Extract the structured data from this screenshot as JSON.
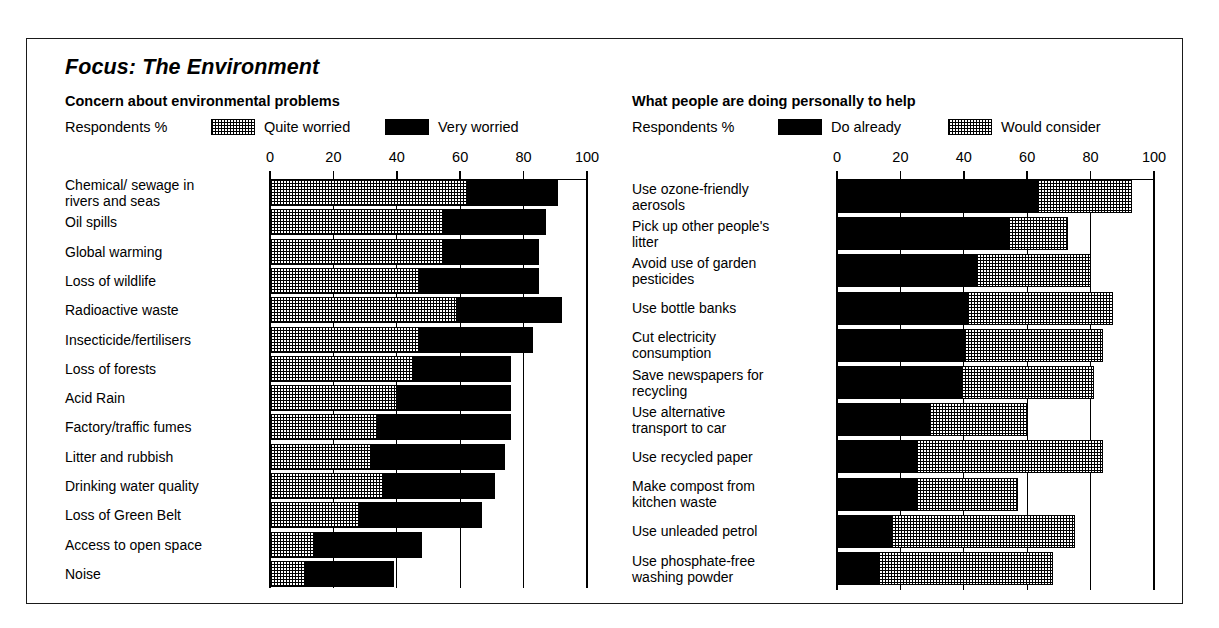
{
  "figure": {
    "title": "Focus: The Environment"
  },
  "panels": [
    {
      "id": "concern",
      "heading": "Concern about environmental problems",
      "unit_label": "Respondents %",
      "legend": [
        {
          "label": "Quite worried",
          "style": "dotted"
        },
        {
          "label": "Very worried",
          "style": "solid-black"
        }
      ]
    },
    {
      "id": "actions",
      "heading": "What people are doing personally to help",
      "unit_label": "Respondents %",
      "legend": [
        {
          "label": "Do already",
          "style": "solid-black"
        },
        {
          "label": "Would consider",
          "style": "dotted"
        }
      ]
    }
  ],
  "chart_data": [
    {
      "type": "bar",
      "orientation": "horizontal",
      "stacked": true,
      "title": "Concern about environmental problems",
      "xlabel": "Respondents %",
      "ylabel": "",
      "xlim": [
        0,
        100
      ],
      "ticks": [
        0,
        20,
        40,
        60,
        80,
        100
      ],
      "grid": true,
      "legend_position": "top",
      "categories": [
        "Chemical/ sewage in rivers and seas",
        "Oil spills",
        "Global warming",
        "Loss of wildlife",
        "Radioactive waste",
        "Insecticide/fertilisers",
        "Loss of forests",
        "Acid Rain",
        "Factory/traffic fumes",
        "Litter and rubbish",
        "Drinking water quality",
        "Loss of Green Belt",
        "Access to open space",
        "Noise"
      ],
      "series": [
        {
          "name": "Quite worried",
          "style": "dotted",
          "values": [
            62,
            55,
            55,
            47,
            59,
            47,
            45,
            40,
            34,
            32,
            36,
            28,
            14,
            11
          ]
        },
        {
          "name": "Very worried",
          "style": "solid-black",
          "values": [
            29,
            32,
            30,
            38,
            33,
            36,
            31,
            36,
            42,
            42,
            35,
            39,
            34,
            28
          ]
        }
      ],
      "totals": [
        91,
        87,
        85,
        85,
        92,
        83,
        76,
        76,
        76,
        74,
        71,
        67,
        48,
        39
      ]
    },
    {
      "type": "bar",
      "orientation": "horizontal",
      "stacked": true,
      "title": "What people are doing personally to help",
      "xlabel": "Respondents %",
      "ylabel": "",
      "xlim": [
        0,
        100
      ],
      "ticks": [
        0,
        20,
        40,
        60,
        80,
        100
      ],
      "grid": true,
      "legend_position": "top",
      "categories": [
        "Use ozone-friendly aerosols",
        "Pick up other people's litter",
        "Avoid use of garden pesticides",
        "Use bottle banks",
        "Cut electricity consumption",
        "Save newspapers for recycling",
        "Use alternative transport to car",
        "Use recycled paper",
        "Make compost from kitchen waste",
        "Use unleaded petrol",
        "Use phosphate-free washing powder"
      ],
      "series": [
        {
          "name": "Do already",
          "style": "solid-black",
          "values": [
            63,
            54,
            44,
            41,
            40,
            39,
            29,
            25,
            25,
            17,
            13
          ]
        },
        {
          "name": "Would consider",
          "style": "dotted",
          "values": [
            30,
            19,
            36,
            46,
            44,
            42,
            31,
            59,
            32,
            58,
            55
          ]
        }
      ],
      "totals": [
        93,
        73,
        80,
        87,
        84,
        81,
        60,
        84,
        57,
        75,
        68
      ]
    }
  ],
  "left_rows": [
    {
      "label": "Chemical/ sewage in\nrivers and seas",
      "quite": 62,
      "very": 29
    },
    {
      "label": "Oil spills",
      "quite": 55,
      "very": 32
    },
    {
      "label": "Global warming",
      "quite": 55,
      "very": 30
    },
    {
      "label": "Loss of wildlife",
      "quite": 47,
      "very": 38
    },
    {
      "label": "Radioactive waste",
      "quite": 59,
      "very": 33
    },
    {
      "label": "Insecticide/fertilisers",
      "quite": 47,
      "very": 36
    },
    {
      "label": "Loss of forests",
      "quite": 45,
      "very": 31
    },
    {
      "label": "Acid Rain",
      "quite": 40,
      "very": 36
    },
    {
      "label": "Factory/traffic fumes",
      "quite": 34,
      "very": 42
    },
    {
      "label": "Litter and rubbish",
      "quite": 32,
      "very": 42
    },
    {
      "label": "Drinking water quality",
      "quite": 36,
      "very": 35
    },
    {
      "label": "Loss of Green Belt",
      "quite": 28,
      "very": 39
    },
    {
      "label": "Access to open space",
      "quite": 14,
      "very": 34
    },
    {
      "label": "Noise",
      "quite": 11,
      "very": 28
    }
  ],
  "right_rows": [
    {
      "label": "Use ozone-friendly\naerosols",
      "already": 63,
      "consider": 30
    },
    {
      "label": "Pick up other people's\nlitter",
      "already": 54,
      "consider": 19
    },
    {
      "label": "Avoid use of garden\npesticides",
      "already": 44,
      "consider": 36
    },
    {
      "label": "Use bottle banks",
      "already": 41,
      "consider": 46
    },
    {
      "label": "Cut electricity\nconsumption",
      "already": 40,
      "consider": 44
    },
    {
      "label": "Save newspapers for\nrecycling",
      "already": 39,
      "consider": 42
    },
    {
      "label": "Use alternative\ntransport to car",
      "already": 29,
      "consider": 31
    },
    {
      "label": "Use recycled paper",
      "already": 25,
      "consider": 59
    },
    {
      "label": "Make compost from\nkitchen waste",
      "already": 25,
      "consider": 32
    },
    {
      "label": "Use unleaded petrol",
      "already": 17,
      "consider": 58
    },
    {
      "label": "Use phosphate-free\nwashing powder",
      "already": 13,
      "consider": 55
    }
  ],
  "axis": {
    "ticks": [
      "0",
      "20",
      "40",
      "60",
      "80",
      "100"
    ]
  },
  "colors": {
    "ink": "#000000",
    "paper": "#ffffff"
  }
}
